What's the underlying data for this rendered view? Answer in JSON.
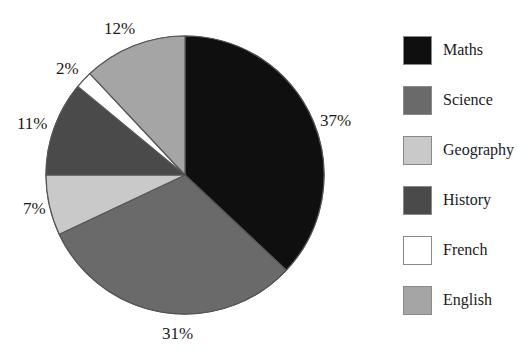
{
  "chart_data": {
    "type": "pie",
    "title": "",
    "labels": [
      "Maths",
      "Science",
      "Geography",
      "History",
      "French",
      "English"
    ],
    "values": [
      37,
      31,
      7,
      11,
      2,
      12
    ],
    "value_labels": [
      "37%",
      "31%",
      "7%",
      "11%",
      "2%",
      "12%"
    ],
    "unit": "%",
    "colors": [
      "#0f0f0f",
      "#6a6a6a",
      "#c9c9c9",
      "#4a4a4a",
      "#ffffff",
      "#a5a5a5"
    ],
    "slice_order": "clockwise-from-top",
    "legend_position": "right",
    "grid": false,
    "slice_outline_color": "#555555"
  },
  "pie": {
    "labels": [
      {
        "name": "maths-pct",
        "text": "37%"
      },
      {
        "name": "science-pct",
        "text": "31%"
      },
      {
        "name": "geography-pct",
        "text": "7%"
      },
      {
        "name": "history-pct",
        "text": "11%"
      },
      {
        "name": "french-pct",
        "text": "2%"
      },
      {
        "name": "english-pct",
        "text": "12%"
      }
    ]
  },
  "legend": {
    "items": [
      {
        "label": "Maths",
        "color": "#0f0f0f"
      },
      {
        "label": "Science",
        "color": "#6a6a6a"
      },
      {
        "label": "Geography",
        "color": "#c9c9c9"
      },
      {
        "label": "History",
        "color": "#4a4a4a"
      },
      {
        "label": "French",
        "color": "#ffffff"
      },
      {
        "label": "English",
        "color": "#a5a5a5"
      }
    ]
  }
}
